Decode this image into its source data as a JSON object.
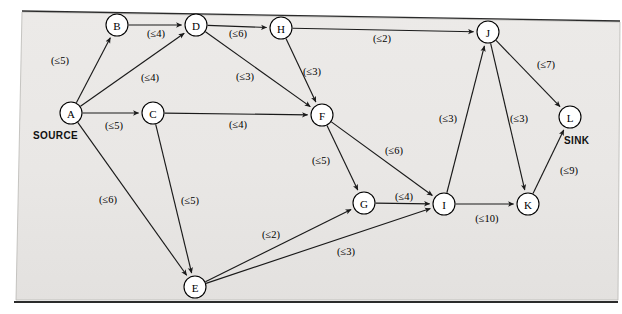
{
  "figure": {
    "background_color": "#e9e9e7",
    "page_color": "#ffffff",
    "line_color": "#1a1a1a"
  },
  "terminals": {
    "source_label": "SOURCE",
    "sink_label": "SINK"
  },
  "nodes": [
    {
      "id": "A",
      "label": "A",
      "x": 71,
      "y": 113,
      "r": 11
    },
    {
      "id": "B",
      "label": "B",
      "x": 117,
      "y": 25,
      "r": 11
    },
    {
      "id": "C",
      "label": "C",
      "x": 153,
      "y": 113,
      "r": 11
    },
    {
      "id": "D",
      "label": "D",
      "x": 196,
      "y": 25,
      "r": 11
    },
    {
      "id": "E",
      "label": "E",
      "x": 195,
      "y": 287,
      "r": 11
    },
    {
      "id": "F",
      "label": "F",
      "x": 322,
      "y": 115,
      "r": 11
    },
    {
      "id": "G",
      "label": "G",
      "x": 364,
      "y": 203,
      "r": 11
    },
    {
      "id": "H",
      "label": "H",
      "x": 281,
      "y": 28,
      "r": 11
    },
    {
      "id": "I",
      "label": "I",
      "x": 444,
      "y": 204,
      "r": 11
    },
    {
      "id": "J",
      "label": "J",
      "x": 488,
      "y": 32,
      "r": 11
    },
    {
      "id": "K",
      "label": "K",
      "x": 528,
      "y": 204,
      "r": 11
    },
    {
      "id": "L",
      "label": "L",
      "x": 570,
      "y": 117,
      "r": 11
    }
  ],
  "edges": [
    {
      "from": "A",
      "to": "B",
      "capacity": 5,
      "label": "(≤5)",
      "label_x": 60,
      "label_y": 60
    },
    {
      "from": "A",
      "to": "D",
      "capacity": 4,
      "label": "(≤4)",
      "label_x": 150,
      "label_y": 77
    },
    {
      "from": "A",
      "to": "C",
      "capacity": 5,
      "label": "(≤5)",
      "label_x": 114,
      "label_y": 125
    },
    {
      "from": "A",
      "to": "E",
      "capacity": 6,
      "label": "(≤6)",
      "label_x": 108,
      "label_y": 199
    },
    {
      "from": "B",
      "to": "D",
      "capacity": 4,
      "label": "(≤4)",
      "label_x": 156,
      "label_y": 33
    },
    {
      "from": "C",
      "to": "F",
      "capacity": 4,
      "label": "(≤4)",
      "label_x": 238,
      "label_y": 124
    },
    {
      "from": "C",
      "to": "E",
      "capacity": 5,
      "label": "(≤5)",
      "label_x": 190,
      "label_y": 200
    },
    {
      "from": "D",
      "to": "H",
      "capacity": 6,
      "label": "(≤6)",
      "label_x": 238,
      "label_y": 33
    },
    {
      "from": "D",
      "to": "F",
      "capacity": 3,
      "label": "(≤3)",
      "label_x": 245,
      "label_y": 76
    },
    {
      "from": "E",
      "to": "G",
      "capacity": 2,
      "label": "(≤2)",
      "label_x": 271,
      "label_y": 234
    },
    {
      "from": "E",
      "to": "I",
      "capacity": 3,
      "label": "(≤3)",
      "label_x": 346,
      "label_y": 251
    },
    {
      "from": "F",
      "to": "G",
      "capacity": 5,
      "label": "(≤5)",
      "label_x": 321,
      "label_y": 160
    },
    {
      "from": "F",
      "to": "I",
      "capacity": 6,
      "label": "(≤6)",
      "label_x": 394,
      "label_y": 150
    },
    {
      "from": "G",
      "to": "I",
      "capacity": 4,
      "label": "(≤4)",
      "label_x": 404,
      "label_y": 196
    },
    {
      "from": "H",
      "to": "J",
      "capacity": 2,
      "label": "(≤2)",
      "label_x": 382,
      "label_y": 38
    },
    {
      "from": "H",
      "to": "F",
      "capacity": 3,
      "label": "(≤3)",
      "label_x": 312,
      "label_y": 71
    },
    {
      "from": "I",
      "to": "J",
      "capacity": 3,
      "label": "(≤3)",
      "label_x": 448,
      "label_y": 118
    },
    {
      "from": "I",
      "to": "K",
      "capacity": 10,
      "label": "(≤10)",
      "label_x": 487,
      "label_y": 218
    },
    {
      "from": "J",
      "to": "K",
      "capacity": 3,
      "label": "(≤3)",
      "label_x": 519,
      "label_y": 118
    },
    {
      "from": "J",
      "to": "L",
      "capacity": 7,
      "label": "(≤7)",
      "label_x": 546,
      "label_y": 64
    },
    {
      "from": "K",
      "to": "L",
      "capacity": 9,
      "label": "(≤9)",
      "label_x": 569,
      "label_y": 170
    }
  ],
  "annotations": {
    "source_x": 33,
    "source_y": 135,
    "sink_x": 564,
    "sink_y": 140
  }
}
